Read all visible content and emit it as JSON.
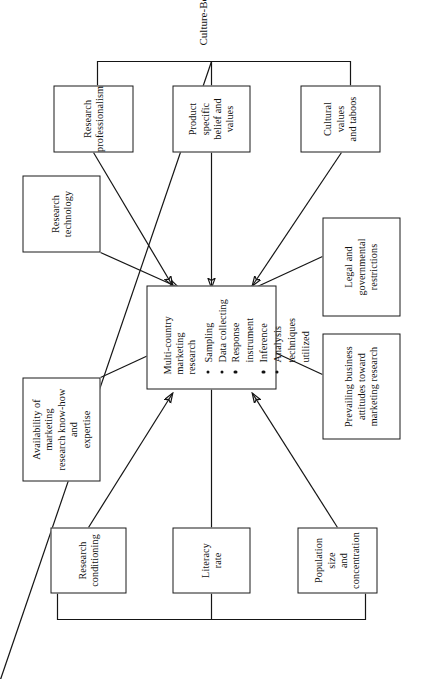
{
  "figure": {
    "caption": "Culture-Bound Impediments",
    "center": {
      "title": "Multi-country marketing research",
      "bullets": [
        "Sampling",
        "Data collecting",
        "Response instrument",
        "Inference",
        "Analysis techniques utilized"
      ]
    },
    "nodes": [
      {
        "id": "research-conditioning",
        "label": "Research\nconditioning"
      },
      {
        "id": "literacy-rate",
        "label": "Literacy\nrate"
      },
      {
        "id": "population-size",
        "label": "Population size\nand\nconcentration"
      },
      {
        "id": "availability-knowhow",
        "label": "Availability of marketing\nresearch know-how and\nexpertise"
      },
      {
        "id": "research-technology",
        "label": "Research\ntechnology"
      },
      {
        "id": "prevailing-attitudes",
        "label": "Prevailing business\nattitudes toward\nmarketing research"
      },
      {
        "id": "legal-restrictions",
        "label": "Legal and\ngovernmental\nrestrictions"
      },
      {
        "id": "research-professionalism",
        "label": "Research\nprofessionalism"
      },
      {
        "id": "product-specific-belief",
        "label": "Product specific\nbelief and values"
      },
      {
        "id": "cultural-values",
        "label": "Cultural values\nand taboos"
      }
    ],
    "colors": {
      "stroke": "#151515",
      "fill": "#ffffff",
      "text": "#111111"
    }
  }
}
